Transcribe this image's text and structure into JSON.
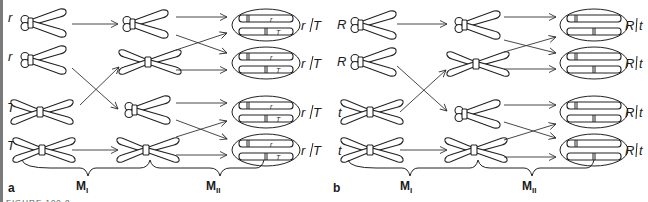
{
  "figure": {
    "caption_fragment": "FIGURE 100.8",
    "panels": [
      {
        "id": "a",
        "label": "a",
        "parent_alleles": [
          "r",
          "r",
          "T",
          "T"
        ],
        "stage_labels": {
          "m1": "M",
          "m1_sub": "I",
          "m2": "M",
          "m2_sub": "II"
        },
        "products": [
          {
            "genotype": "r",
            "separator": "/",
            "genotype2": "T",
            "top_allele": "r",
            "bottom_allele": "T"
          },
          {
            "genotype": "r",
            "separator": "/",
            "genotype2": "T",
            "top_allele": "r",
            "bottom_allele": "T"
          },
          {
            "genotype": "r",
            "separator": "/",
            "genotype2": "T",
            "top_allele": "r",
            "bottom_allele": "T"
          },
          {
            "genotype": "r",
            "separator": "/",
            "genotype2": "T",
            "top_allele": "r",
            "bottom_allele": "T"
          }
        ]
      },
      {
        "id": "b",
        "label": "b",
        "parent_alleles": [
          "R",
          "R",
          "t",
          "t"
        ],
        "stage_labels": {
          "m1": "M",
          "m1_sub": "I",
          "m2": "M",
          "m2_sub": "II"
        },
        "products": [
          {
            "genotype": "R",
            "separator": "/",
            "genotype2": "t"
          },
          {
            "genotype": "R",
            "separator": "/",
            "genotype2": "t"
          },
          {
            "genotype": "R",
            "separator": "/",
            "genotype2": "t"
          },
          {
            "genotype": "R",
            "separator": "/",
            "genotype2": "t"
          }
        ]
      }
    ]
  },
  "colors": {
    "line": "#222222",
    "background": "#ffffff",
    "edge": "#7a7a7a"
  }
}
